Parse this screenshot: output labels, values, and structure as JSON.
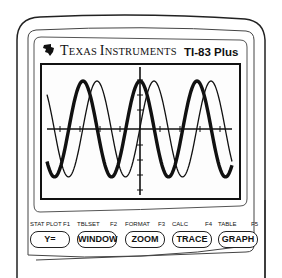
{
  "device": {
    "brand": "Texas Instruments",
    "brand_display": {
      "t1": "T",
      "r1": "EXAS ",
      "t2": "I",
      "r2": "NSTRUMENTS"
    },
    "model": "TI-83 Plus",
    "colors": {
      "ink": "#111111",
      "body": "#ffffff"
    }
  },
  "screen": {
    "type": "graph",
    "description": "Two sinusoidal curves plotted on axes; one thick, one thin, phase-shifted",
    "curves": [
      {
        "name": "thick",
        "style": "bold",
        "amplitude_px": 48,
        "period_px": 57,
        "peak_x_px": 140
      },
      {
        "name": "thin",
        "style": "thin",
        "amplitude_px": 48,
        "period_px": 57,
        "peak_x_px": 154
      }
    ]
  },
  "keys": [
    {
      "top_left": "STAT PLOT",
      "top_right": "F1",
      "label": "Y="
    },
    {
      "top_left": "TBLSET",
      "top_right": "F2",
      "label": "WINDOW"
    },
    {
      "top_left": "FORMAT",
      "top_right": "F3",
      "label": "ZOOM"
    },
    {
      "top_left": "CALC",
      "top_right": "F4",
      "label": "TRACE"
    },
    {
      "top_left": "TABLE",
      "top_right": "F5",
      "label": "GRAPH"
    }
  ]
}
